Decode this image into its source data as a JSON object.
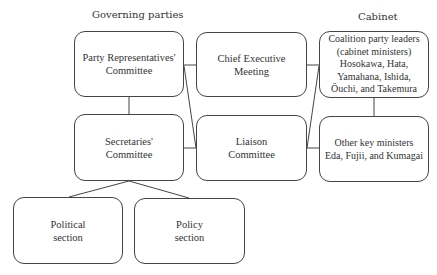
{
  "headings": {
    "governing_parties": "Governing parties",
    "cabinet": "Cabinet"
  },
  "boxes": {
    "party_representatives": "Party Representatives' Committee",
    "secretaries": "Secretaries' Committee",
    "political_section": "Political section",
    "policy_section": "Policy section",
    "chief_executive": "Chief Executive Meeting",
    "liaison": "Liaison Committee",
    "coalition_leaders": "Coalition party leaders (cabinet ministers) Hosokawa, Hata, Yamahana, Ishida, Ōuchi, and Takemura",
    "other_ministers": "Other key ministers Eda, Fujii, and Kumagai"
  },
  "box_lines": {
    "party_representatives": [
      "Party Representatives'",
      "Committee"
    ],
    "secretaries": [
      "Secretaries'",
      "Committee"
    ],
    "political_section": [
      "Political",
      "section"
    ],
    "policy_section": [
      "Policy",
      "section"
    ],
    "chief_executive": [
      "Chief Executive",
      "Meeting"
    ],
    "liaison": [
      "Liaison",
      "Committee"
    ],
    "coalition_leaders": [
      "Coalition party leaders",
      "(cabinet ministers)",
      "Hosokawa, Hata,",
      "Yamahana, Ishida,",
      "Ōuchi, and Takemura"
    ],
    "other_ministers": [
      "Other key ministers",
      "Eda, Fujii, and Kumagai"
    ]
  },
  "edges": [
    [
      "party_representatives",
      "chief_executive"
    ],
    [
      "party_representatives",
      "secretaries"
    ],
    [
      "party_representatives",
      "liaison"
    ],
    [
      "secretaries",
      "liaison"
    ],
    [
      "secretaries",
      "political_section"
    ],
    [
      "secretaries",
      "policy_section"
    ],
    [
      "chief_executive",
      "coalition_leaders"
    ],
    [
      "liaison",
      "coalition_leaders"
    ],
    [
      "liaison",
      "other_ministers"
    ],
    [
      "coalition_leaders",
      "other_ministers"
    ]
  ]
}
